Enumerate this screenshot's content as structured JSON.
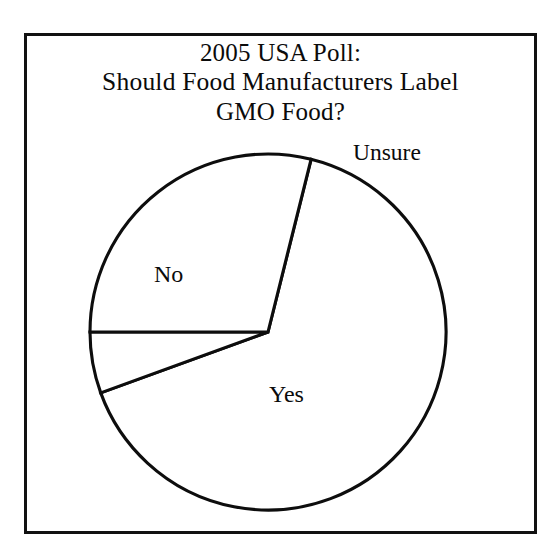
{
  "figure": {
    "kind": "pie-chart-figure",
    "background_color": "#ffffff",
    "border_color": "#111111",
    "ink_color": "#0d0d0d"
  },
  "title": {
    "line1": "2005 USA Poll:",
    "line2": "Should Food Manufacturers Label",
    "line3": "GMO Food?"
  },
  "labels": {
    "no": "No",
    "yes": "Yes",
    "unsure": "Unsure"
  },
  "chart_data": {
    "type": "pie",
    "title": "2005 USA Poll: Should Food Manufacturers Label GMO Food?",
    "categories": [
      "No",
      "Unsure",
      "Yes"
    ],
    "values": [
      65.6,
      5.6,
      28.8
    ],
    "units": "percent",
    "slice_angles_deg": [
      236,
      20,
      104
    ],
    "start_angle_deg": 14,
    "direction": "clockwise",
    "labels_inside": [
      "No",
      "Yes"
    ],
    "labels_outside": [
      "Unsure"
    ],
    "legend": "none",
    "grid": false,
    "fill": "none",
    "stroke": "#0d0d0d",
    "xlabel": "",
    "ylabel": "",
    "annotations": []
  },
  "geometry": {
    "center_x": 268,
    "center_y": 332,
    "radius": 178,
    "boundaries_deg": [
      14,
      34,
      138
    ]
  }
}
